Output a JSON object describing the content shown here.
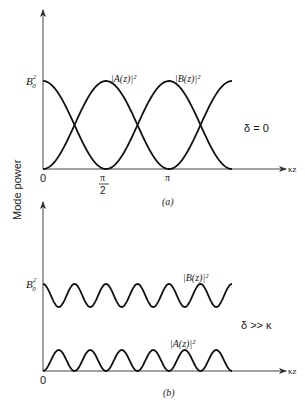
{
  "figure": {
    "y_axis_label": "Mode power",
    "panel_a": {
      "caption": "(a)",
      "condition": "δ = 0",
      "y_tick": "B",
      "y_tick_sub": "0",
      "y_tick_sup": "2",
      "x_ticks": [
        "0",
        "π",
        "2",
        "π"
      ],
      "x_axis_label": "κz",
      "curve_labels": {
        "A": "|A(z)|²",
        "B": "|B(z)|²"
      }
    },
    "panel_b": {
      "caption": "(b)",
      "condition": "δ >> κ",
      "y_tick": "B",
      "y_tick_sub": "0",
      "y_tick_sup": "2",
      "x_ticks": [
        "0"
      ],
      "x_axis_label": "κz",
      "curve_labels": {
        "A": "|A(z)|²",
        "B": "|B(z)|²"
      }
    }
  },
  "chart_data": [
    {
      "type": "line",
      "title": "(a) δ = 0",
      "xlabel": "κz",
      "ylabel": "Mode power",
      "x_ticks": [
        "0",
        "π/2",
        "π"
      ],
      "y_ticks": [
        "B0²"
      ],
      "xlim": [
        0,
        4.71
      ],
      "ylim": [
        0,
        1.0
      ],
      "x": [
        0,
        0.785,
        1.571,
        2.356,
        3.142,
        3.927,
        4.712
      ],
      "series": [
        {
          "name": "|A(z)|²",
          "values": [
            0,
            0.5,
            1.0,
            0.5,
            0,
            0.5,
            1.0
          ]
        },
        {
          "name": "|B(z)|²",
          "values": [
            1.0,
            0.5,
            0,
            0.5,
            1.0,
            0.5,
            0
          ]
        }
      ],
      "annotations": [
        "δ = 0"
      ]
    },
    {
      "type": "line",
      "title": "(b) δ >> κ",
      "xlabel": "κz",
      "ylabel": "Mode power",
      "x_ticks": [
        "0"
      ],
      "y_ticks": [
        "B0²"
      ],
      "ylim": [
        0,
        1.0
      ],
      "series": [
        {
          "name": "|B(z)|²",
          "description": "oscillates between B0² and ~0.74 B0², ~6 periods",
          "max": 1.0,
          "min": 0.74
        },
        {
          "name": "|A(z)|²",
          "description": "oscillates between 0 and ~0.26 B0², ~6 periods",
          "max": 0.26,
          "min": 0
        }
      ],
      "annotations": [
        "δ >> κ"
      ]
    }
  ]
}
